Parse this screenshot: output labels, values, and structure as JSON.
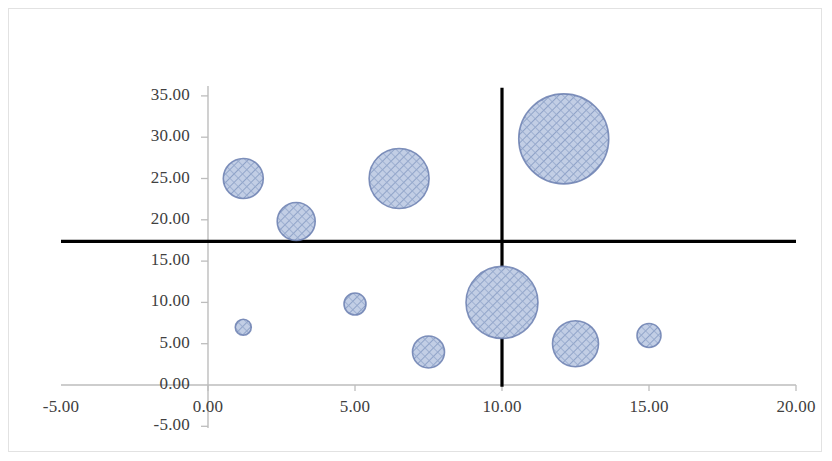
{
  "chart_data": {
    "type": "scatter",
    "subtype": "bubble",
    "title": "",
    "xlabel": "",
    "ylabel": "",
    "xlim": [
      -5.0,
      20.0
    ],
    "ylim": [
      -5.0,
      35.0
    ],
    "x_ticks": [
      "-5.00",
      "0.00",
      "5.00",
      "10.00",
      "15.00",
      "20.00"
    ],
    "x_tick_values": [
      -5.0,
      0.0,
      5.0,
      10.0,
      15.0,
      20.0
    ],
    "y_ticks": [
      "-5.00",
      "0.00",
      "5.00",
      "10.00",
      "15.00",
      "20.00",
      "25.00",
      "30.00",
      "35.00"
    ],
    "y_tick_values": [
      -5.0,
      0.0,
      5.0,
      10.0,
      15.0,
      20.0,
      25.0,
      30.0,
      35.0
    ],
    "grid": false,
    "legend": false,
    "legend_position": "none",
    "bubble_fill": "#b2c0dc",
    "bubble_stroke": "#6b7fb0",
    "hatch": "crosshatch-diagonal",
    "reference_lines": [
      {
        "name": "horizontal-quadrant-line",
        "orientation": "horizontal",
        "value": 17.4,
        "color": "#000000",
        "x_start": -5.0,
        "x_end": 20.0
      },
      {
        "name": "vertical-quadrant-line",
        "orientation": "vertical",
        "value": 10.0,
        "color": "#000000",
        "y_start": -0.2,
        "y_end": 36.0
      }
    ],
    "points": [
      {
        "x": 1.2,
        "y": 25.0,
        "r_px": 20,
        "label": ""
      },
      {
        "x": 3.0,
        "y": 19.8,
        "r_px": 19,
        "label": ""
      },
      {
        "x": 6.5,
        "y": 25.0,
        "r_px": 30,
        "label": ""
      },
      {
        "x": 12.1,
        "y": 29.8,
        "r_px": 45,
        "label": ""
      },
      {
        "x": 10.0,
        "y": 10.0,
        "r_px": 36,
        "label": ""
      },
      {
        "x": 1.2,
        "y": 7.0,
        "r_px": 8,
        "label": ""
      },
      {
        "x": 5.0,
        "y": 9.8,
        "r_px": 11,
        "label": ""
      },
      {
        "x": 7.5,
        "y": 4.0,
        "r_px": 16,
        "label": ""
      },
      {
        "x": 12.5,
        "y": 5.0,
        "r_px": 23,
        "label": ""
      },
      {
        "x": 15.0,
        "y": 6.0,
        "r_px": 12,
        "label": ""
      }
    ]
  },
  "axes": {
    "x_axis_color": "#b9b9b9",
    "y_axis_color": "#b9b9b9",
    "tick_label_color": "#404040"
  }
}
